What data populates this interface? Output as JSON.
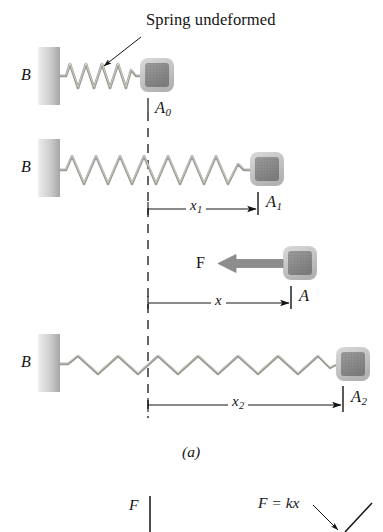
{
  "figure": {
    "caption": "(a)",
    "callout": "Spring undeformed",
    "wall_label": "B",
    "force_label": "F"
  },
  "rows": [
    {
      "name": "undeformed",
      "block_label": "A",
      "block_subscript": "0"
    },
    {
      "name": "stretched-x1",
      "block_label": "A",
      "block_subscript": "1",
      "dimension_label": "x",
      "dimension_subscript": "1"
    },
    {
      "name": "force-applied",
      "block_label": "A",
      "block_subscript": "",
      "dimension_label": "x",
      "dimension_subscript": ""
    },
    {
      "name": "stretched-x2",
      "block_label": "A",
      "block_subscript": "2",
      "dimension_label": "x",
      "dimension_subscript": "2"
    }
  ],
  "graph": {
    "y_axis_label": "F",
    "curve_label": "F = kx"
  },
  "colors": {
    "ink": "#141414",
    "spring": "#9a9a94",
    "spring_highlight": "#cfcfc8",
    "wall_light": "#e2e2e2",
    "wall_dark": "#a8a8a8",
    "block_fill": "#8f8f8f",
    "block_border": "#c2c2c2",
    "arrow_grey": "#8d8d8d"
  }
}
